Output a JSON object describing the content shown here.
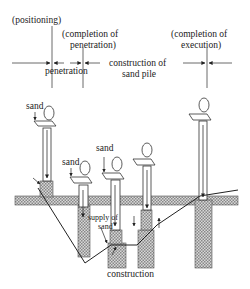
{
  "timeline": {
    "positioning": "(positioning)",
    "completion_of_penetration_1": "(completion of",
    "completion_of_penetration_2": "penetration)",
    "completion_of_execution_1": "(completion of",
    "completion_of_execution_2": "execution)",
    "penetration": "penetration",
    "construction_1": "construction of",
    "construction_2": "sand pile"
  },
  "diagram": {
    "sand_label_1": "sand",
    "sand_label_2": "sand",
    "sand_label_3": "sand",
    "supply_1": "supply of",
    "supply_2": "sand",
    "construction": "construction"
  },
  "colors": {
    "line": "#222222",
    "hatch": "#aaaaaa",
    "background": "#ffffff"
  }
}
